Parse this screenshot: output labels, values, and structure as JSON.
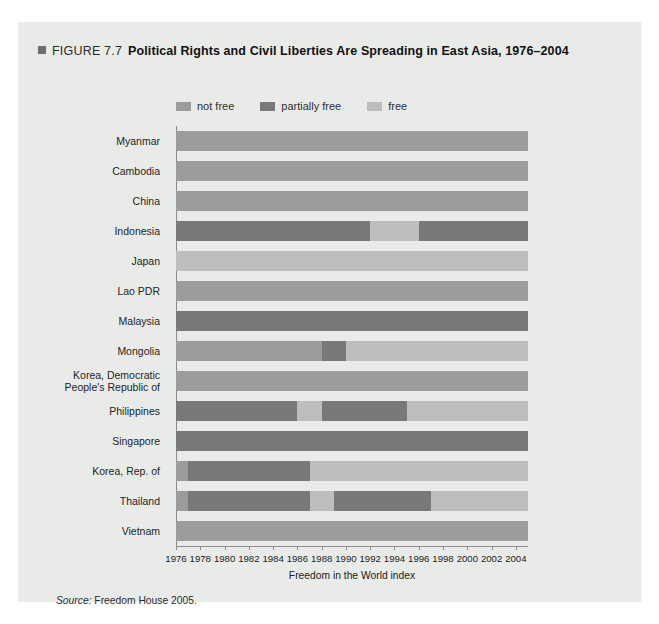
{
  "figure": {
    "label": "FIGURE 7.7",
    "title": "Political Rights and Civil Liberties Are Spreading in East Asia, 1976–2004",
    "source_word": "Source:",
    "source_text": " Freedom House 2005."
  },
  "legend": {
    "position": "top",
    "items": [
      {
        "label": "not free",
        "key": "not_free",
        "color": "#9b9d9b"
      },
      {
        "label": "partially free",
        "key": "partially_free",
        "color": "#77797a"
      },
      {
        "label": "free",
        "key": "free",
        "color": "#bcbebc"
      }
    ]
  },
  "axes": {
    "xlabel": "Freedom in the World index",
    "xlim": [
      1976,
      2005
    ],
    "xticks": [
      1976,
      1978,
      1980,
      1982,
      1984,
      1986,
      1988,
      1990,
      1992,
      1994,
      1996,
      1998,
      2000,
      2002,
      2004
    ],
    "xticklabels": [
      "1976",
      "1978",
      "1980",
      "1982",
      "1984",
      "1986",
      "1988",
      "1990",
      "1992",
      "1994",
      "1996",
      "1998",
      "2000",
      "2002",
      "2004"
    ],
    "grid": false
  },
  "chart_data": {
    "type": "bar",
    "orientation": "horizontal-timeline",
    "title": "Political Rights and Civil Liberties Are Spreading in East Asia, 1976–2004",
    "xlabel": "Freedom in the World index",
    "ylabel": "",
    "xlim": [
      1976,
      2005
    ],
    "categories": [
      "Myanmar",
      "Cambodia",
      "China",
      "Indonesia",
      "Japan",
      "Lao PDR",
      "Malaysia",
      "Mongolia",
      "Korea, Democratic People's Republic of",
      "Philippines",
      "Singapore",
      "Korea, Rep. of",
      "Thailand",
      "Vietnam"
    ],
    "status_colors": {
      "not_free": "#9b9d9b",
      "partially_free": "#77797a",
      "free": "#bcbebc"
    },
    "series": [
      {
        "name": "Myanmar",
        "segments": [
          {
            "status": "not_free",
            "start": 1976,
            "end": 2005
          }
        ]
      },
      {
        "name": "Cambodia",
        "segments": [
          {
            "status": "not_free",
            "start": 1976,
            "end": 2005
          }
        ]
      },
      {
        "name": "China",
        "segments": [
          {
            "status": "not_free",
            "start": 1976,
            "end": 2005
          }
        ]
      },
      {
        "name": "Indonesia",
        "segments": [
          {
            "status": "partially_free",
            "start": 1976,
            "end": 1992
          },
          {
            "status": "free",
            "start": 1992,
            "end": 1996
          },
          {
            "status": "partially_free",
            "start": 1996,
            "end": 2005
          }
        ]
      },
      {
        "name": "Japan",
        "segments": [
          {
            "status": "free",
            "start": 1976,
            "end": 2005
          }
        ]
      },
      {
        "name": "Lao PDR",
        "segments": [
          {
            "status": "not_free",
            "start": 1976,
            "end": 2005
          }
        ]
      },
      {
        "name": "Malaysia",
        "segments": [
          {
            "status": "partially_free",
            "start": 1976,
            "end": 2005
          }
        ]
      },
      {
        "name": "Mongolia",
        "segments": [
          {
            "status": "not_free",
            "start": 1976,
            "end": 1988
          },
          {
            "status": "partially_free",
            "start": 1988,
            "end": 1990
          },
          {
            "status": "free",
            "start": 1990,
            "end": 2005
          }
        ]
      },
      {
        "name": "Korea, Democratic People's Republic of",
        "segments": [
          {
            "status": "not_free",
            "start": 1976,
            "end": 2005
          }
        ]
      },
      {
        "name": "Philippines",
        "segments": [
          {
            "status": "partially_free",
            "start": 1976,
            "end": 1986
          },
          {
            "status": "free",
            "start": 1986,
            "end": 1988
          },
          {
            "status": "partially_free",
            "start": 1988,
            "end": 1995
          },
          {
            "status": "free",
            "start": 1995,
            "end": 2005
          }
        ]
      },
      {
        "name": "Singapore",
        "segments": [
          {
            "status": "partially_free",
            "start": 1976,
            "end": 2005
          }
        ]
      },
      {
        "name": "Korea, Rep. of",
        "segments": [
          {
            "status": "not_free",
            "start": 1976,
            "end": 1977
          },
          {
            "status": "partially_free",
            "start": 1977,
            "end": 1987
          },
          {
            "status": "free",
            "start": 1987,
            "end": 2005
          }
        ]
      },
      {
        "name": "Thailand",
        "segments": [
          {
            "status": "not_free",
            "start": 1976,
            "end": 1977
          },
          {
            "status": "partially_free",
            "start": 1977,
            "end": 1987
          },
          {
            "status": "free",
            "start": 1987,
            "end": 1989
          },
          {
            "status": "partially_free",
            "start": 1989,
            "end": 1997
          },
          {
            "status": "free",
            "start": 1997,
            "end": 2005
          }
        ]
      },
      {
        "name": "Vietnam",
        "segments": [
          {
            "status": "not_free",
            "start": 1976,
            "end": 2005
          }
        ]
      }
    ],
    "legend": [
      "not free",
      "partially free",
      "free"
    ],
    "legend_position": "top",
    "source": "Freedom House 2005."
  },
  "ylabel_lines": [
    [
      "Myanmar"
    ],
    [
      "Cambodia"
    ],
    [
      "China"
    ],
    [
      "Indonesia"
    ],
    [
      "Japan"
    ],
    [
      "Lao PDR"
    ],
    [
      "Malaysia"
    ],
    [
      "Mongolia"
    ],
    [
      "Korea, Democratic",
      "People's Republic of"
    ],
    [
      "Philippines"
    ],
    [
      "Singapore"
    ],
    [
      "Korea, Rep. of"
    ],
    [
      "Thailand"
    ],
    [
      "Vietnam"
    ]
  ]
}
